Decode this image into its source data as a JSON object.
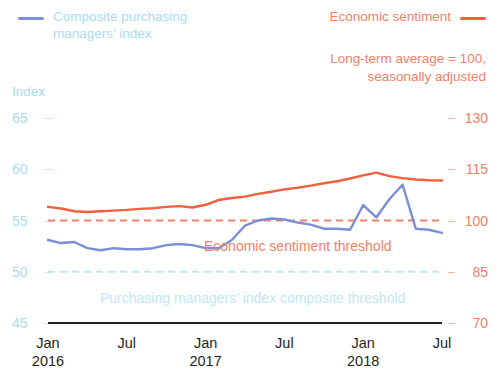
{
  "legend": {
    "left": {
      "label": "Composite purchasing managers’ index",
      "color": "#7a8fd8",
      "text_color": "#a8dcef"
    },
    "right": {
      "label": "Economic sentiment",
      "color": "#f2603c",
      "text_color": "#f2806a"
    }
  },
  "subtitle": {
    "line1": "Long-term average = 100,",
    "line2": "seasonally adjusted"
  },
  "annotations": {
    "economic_sentiment_threshold": "Economic sentiment threshold",
    "pmi_composite_threshold": "Purchasing managers’ index composite threshold"
  },
  "chart_data": {
    "type": "line",
    "title": "",
    "subtitle": "Long-term average = 100, seasonally adjusted",
    "xlabel": "",
    "ylabel": "Index",
    "grid": false,
    "legend_position": "top",
    "x": [
      "2016-01",
      "2016-02",
      "2016-03",
      "2016-04",
      "2016-05",
      "2016-06",
      "2016-07",
      "2016-08",
      "2016-09",
      "2016-10",
      "2016-11",
      "2016-12",
      "2017-01",
      "2017-02",
      "2017-03",
      "2017-04",
      "2017-05",
      "2017-06",
      "2017-07",
      "2017-08",
      "2017-09",
      "2017-10",
      "2017-11",
      "2017-12",
      "2018-01",
      "2018-02",
      "2018-03",
      "2018-04",
      "2018-05",
      "2018-06",
      "2018-07"
    ],
    "xtick_labels": [
      {
        "month": "Jan",
        "year": "2016"
      },
      {
        "month": "Jul",
        "year": ""
      },
      {
        "month": "Jan",
        "year": "2017"
      },
      {
        "month": "Jul",
        "year": ""
      },
      {
        "month": "Jan",
        "year": "2018"
      },
      {
        "month": "Jul",
        "year": ""
      }
    ],
    "axes": {
      "left": {
        "label": "Index",
        "ticks": [
          65,
          60,
          55,
          50,
          45
        ],
        "ylim": [
          45,
          65
        ],
        "color": "#a8dcef"
      },
      "right": {
        "label": "",
        "ticks": [
          130,
          115,
          100,
          85,
          70
        ],
        "ylim": [
          70,
          130
        ],
        "color": "#f2806a"
      }
    },
    "series": [
      {
        "name": "Composite purchasing managers’ index",
        "axis": "left",
        "color": "#7a8fd8",
        "values": [
          53.1,
          52.8,
          52.9,
          52.3,
          52.1,
          52.3,
          52.2,
          52.2,
          52.3,
          52.6,
          52.7,
          52.6,
          52.3,
          52.3,
          53.1,
          54.5,
          55.0,
          55.2,
          55.1,
          54.8,
          54.6,
          54.2,
          54.2,
          54.1,
          56.5,
          55.3,
          57.1,
          58.5,
          54.2,
          54.1,
          53.8
        ]
      },
      {
        "name": "Economic sentiment",
        "axis": "right",
        "color": "#f2603c",
        "values": [
          104.0,
          103.5,
          102.7,
          102.5,
          102.7,
          102.9,
          103.1,
          103.4,
          103.6,
          104.0,
          104.2,
          103.8,
          104.6,
          106.0,
          106.6,
          107.0,
          107.8,
          108.4,
          109.1,
          109.6,
          110.2,
          110.9,
          111.5,
          112.3,
          113.2,
          114.0,
          113.0,
          112.4,
          112.0,
          111.8,
          111.7
        ]
      }
    ],
    "threshold_lines": [
      {
        "name": "Economic sentiment threshold",
        "axis": "right",
        "value": 100,
        "color": "#f2806a",
        "style": "dashed"
      },
      {
        "name": "Purchasing managers’ index composite threshold",
        "axis": "left",
        "value": 50,
        "color": "#bfe7f5",
        "style": "dashed"
      }
    ]
  }
}
